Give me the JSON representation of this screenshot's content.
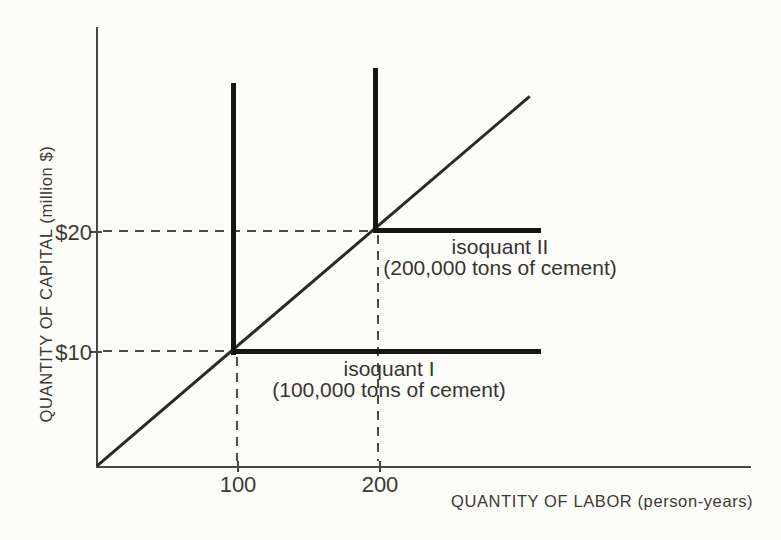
{
  "figure": {
    "y_axis_title": "QUANTITY OF CAPITAL (million $)",
    "x_axis_title": "QUANTITY OF LABOR (person-years)",
    "y_tick_20": "$20",
    "y_tick_10": "$10",
    "x_tick_100": "100",
    "x_tick_200": "200",
    "isoquant_1_name": "isoquant I",
    "isoquant_1_caption": "(100,000 tons of cement)",
    "isoquant_2_name": "isoquant II",
    "isoquant_2_caption": "(200,000 tons of cement)",
    "colors": {
      "background": "#fcfcf9",
      "ink_text": "#3c3931",
      "axis_line": "#4a4742",
      "isoquant_line": "#171513",
      "ray_line": "#2b2925"
    }
  },
  "chart_data": {
    "type": "line",
    "title": "",
    "xlabel": "QUANTITY OF LABOR (person-years)",
    "ylabel": "QUANTITY OF CAPITAL (million $)",
    "xlim": [
      0,
      465
    ],
    "ylim": [
      0,
      37.5
    ],
    "x_ticks": [
      100,
      200
    ],
    "y_ticks": [
      10,
      20
    ],
    "y_tick_labels": [
      "$10",
      "$20"
    ],
    "grid": false,
    "legend_position": "none",
    "series": [
      {
        "name": "isoquant I",
        "annotation": "(100,000 tons of cement)",
        "style": "thick-solid-L-shape",
        "corner": [
          100,
          10
        ],
        "points": [
          [
            100,
            32.7
          ],
          [
            100,
            10
          ],
          [
            317,
            10
          ]
        ]
      },
      {
        "name": "isoquant II",
        "annotation": "(200,000 tons of cement)",
        "style": "thick-solid-L-shape",
        "corner": [
          200,
          20
        ],
        "points": [
          [
            200,
            34
          ],
          [
            200,
            20
          ],
          [
            316,
            20
          ]
        ]
      },
      {
        "name": "expansion ray (diagonal from origin)",
        "annotation": "",
        "style": "thin-solid",
        "points": [
          [
            0,
            0
          ],
          [
            309,
            31.4
          ]
        ]
      }
    ],
    "guides": [
      {
        "style": "dashed",
        "points": [
          [
            0,
            20
          ],
          [
            200,
            20
          ],
          [
            200,
            0
          ]
        ]
      },
      {
        "style": "dashed",
        "points": [
          [
            0,
            10
          ],
          [
            100,
            10
          ],
          [
            100,
            0
          ]
        ]
      }
    ]
  }
}
